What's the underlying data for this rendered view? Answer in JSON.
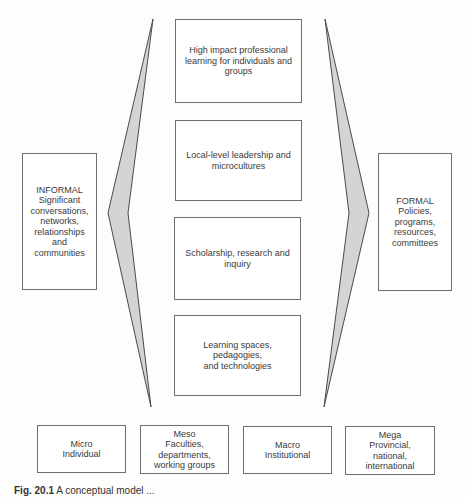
{
  "center_boxes": [
    {
      "label": "High impact professional\nlearning for individuals and\ngroups"
    },
    {
      "label": "Local-level leadership and\nmicrocultures"
    },
    {
      "label": "Scholarship, research and\ninquiry"
    },
    {
      "label": "Learning spaces, pedagogies,\nand technologies"
    }
  ],
  "left_box": {
    "label": "INFORMAL\nSignificant\nconversations,\nnetworks,\nrelationships and\ncommunities"
  },
  "right_box": {
    "label": "FORMAL\nPolicies,\nprograms,\nresources,\ncommittees"
  },
  "bottom_boxes": [
    {
      "label": "Micro\nIndividual"
    },
    {
      "label": "Meso\nFaculties,\ndepartments,\nworking groups"
    },
    {
      "label": "Macro\nInstitutional"
    },
    {
      "label": "Mega\nProvincial, national,\ninternational"
    }
  ],
  "caption": {
    "prefix": "Fig. 20.1",
    "text": "A conceptual model ..."
  },
  "colors": {
    "chevron_fill": "#d4d4d4",
    "chevron_stroke": "#4a4a4a",
    "box_border": "#6e6e6e"
  }
}
